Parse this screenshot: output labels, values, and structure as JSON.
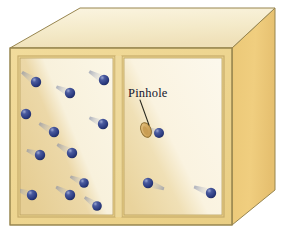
{
  "figure": {
    "type": "diagram"
  },
  "labels": {
    "pinhole": "Pinhole"
  },
  "colors": {
    "box_top_face": "#F7EFD5",
    "box_right_face": "#EFCD7B",
    "box_front_frame": "#EFD489",
    "chamber_fill_dark": "#E8D29A",
    "chamber_fill_light": "#FAF3DE",
    "edge_line": "#8A7A4A",
    "molecule": "#2A3C80",
    "molecule_highlight": "#8C9AC8",
    "trail": "#9AA2B8",
    "pinhole_body": "#D9B26A",
    "pinhole_outline": "#8A6A2A",
    "leader_line": "#2A2A20",
    "label_text": "#14142e",
    "background": "#FFFFFF"
  },
  "geometry": {
    "box": {
      "front_face": {
        "x": 10,
        "y": 48,
        "width": 222,
        "height": 177
      },
      "top_face_points": "10,48 80,8 275,8 232,48",
      "right_face_points": "232,48 275,8 275,190 232,225"
    },
    "left_chamber": {
      "x": 20,
      "y": 58,
      "width": 93,
      "height": 157
    },
    "right_chamber": {
      "x": 124,
      "y": 58,
      "width": 98,
      "height": 157
    },
    "divider": {
      "x": 113,
      "y": 58,
      "width": 11,
      "height": 157
    }
  },
  "pinhole": {
    "cx": 146,
    "cy": 130,
    "rx": 5.0,
    "ry": 7.5,
    "rotation": -22,
    "leader": {
      "x1": 140,
      "y1": 100,
      "x2": 148,
      "y2": 124
    }
  },
  "molecules": {
    "left_chamber_count": 12,
    "right_chamber_count": 3,
    "radius": 5.2,
    "left_chamber": [
      {
        "cx": 36,
        "cy": 82,
        "angle": 215,
        "trail": 17
      },
      {
        "cx": 70,
        "cy": 93,
        "angle": 205,
        "trail": 15
      },
      {
        "cx": 104,
        "cy": 80,
        "angle": 210,
        "trail": 17
      },
      {
        "cx": 26,
        "cy": 114,
        "angle": 200,
        "trail": 16
      },
      {
        "cx": 54,
        "cy": 132,
        "angle": 210,
        "trail": 17
      },
      {
        "cx": 103,
        "cy": 124,
        "angle": 205,
        "trail": 15
      },
      {
        "cx": 40,
        "cy": 155,
        "angle": 200,
        "trail": 14
      },
      {
        "cx": 72,
        "cy": 153,
        "angle": 210,
        "trail": 17
      },
      {
        "cx": 84,
        "cy": 183,
        "angle": 205,
        "trail": 15
      },
      {
        "cx": 32,
        "cy": 195,
        "angle": 200,
        "trail": 16
      },
      {
        "cx": 70,
        "cy": 195,
        "angle": 210,
        "trail": 16
      },
      {
        "cx": 97,
        "cy": 206,
        "angle": 215,
        "trail": 15
      }
    ],
    "right_chamber": [
      {
        "cx": 159,
        "cy": 133,
        "angle": 200,
        "trail": 13
      },
      {
        "cx": 148,
        "cy": 183,
        "angle": 20,
        "trail": 17
      },
      {
        "cx": 211,
        "cy": 193,
        "angle": 200,
        "trail": 18
      }
    ]
  }
}
